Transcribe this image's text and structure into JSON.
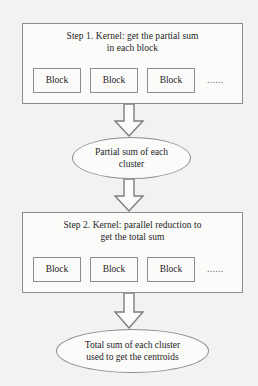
{
  "diagram": {
    "type": "flowchart",
    "orientation": "top-to-bottom",
    "background_color": "#f3f2f0",
    "line_color": "#8d8d8d",
    "text_color": "#1d1d1d",
    "stages": [
      {
        "id": "step-1",
        "title_line_1": "Step 1. Kernel: get the partial sum",
        "title_line_2": "in each block",
        "blocks": [
          {
            "label": "Block"
          },
          {
            "label": "Block"
          },
          {
            "label": "Block"
          }
        ],
        "ellipsis": "......"
      },
      {
        "id": "step-2",
        "title_line_1": "Step 2. Kernel: parallel reduction to",
        "title_line_2": "get the total sum",
        "blocks": [
          {
            "label": "Block"
          },
          {
            "label": "Block"
          },
          {
            "label": "Block"
          }
        ],
        "ellipsis": "......"
      }
    ],
    "ellipses": [
      {
        "id": "partial-sum",
        "line_1": "Partial sum of each",
        "line_2": "cluster"
      },
      {
        "id": "total-sum",
        "line_1": "Total sum of each cluster",
        "line_2": "used to get the centroids"
      }
    ],
    "arrows": [
      {
        "id": "arrow-1",
        "direction": "down",
        "style": "hollow-block"
      },
      {
        "id": "arrow-2",
        "direction": "down",
        "style": "hollow-block"
      },
      {
        "id": "arrow-3",
        "direction": "down",
        "style": "hollow-block"
      }
    ]
  }
}
